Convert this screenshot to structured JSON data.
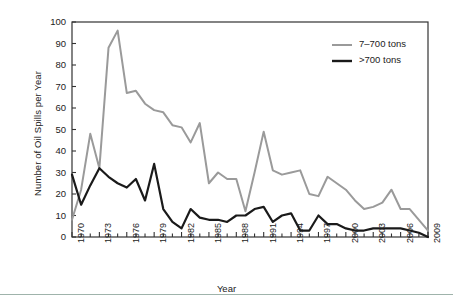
{
  "figure": {
    "background_color": "#ffffff",
    "footer_rule_color": "#9fb3ab"
  },
  "chart_data": {
    "type": "line",
    "title": "",
    "xlabel": "Year",
    "ylabel": "Number of Oil Spills per Year",
    "xlim": [
      1970,
      2009
    ],
    "ylim": [
      0,
      100
    ],
    "yticks": [
      0,
      10,
      20,
      30,
      40,
      50,
      60,
      70,
      80,
      90,
      100
    ],
    "xticks_labeled": [
      1970,
      1973,
      1976,
      1979,
      1982,
      1985,
      1988,
      1991,
      1994,
      1997,
      2000,
      2003,
      2006,
      2009
    ],
    "xtick_interval_minor": 1,
    "grid": false,
    "legend_position": "top-right",
    "x": [
      1970,
      1971,
      1972,
      1973,
      1974,
      1975,
      1976,
      1977,
      1978,
      1979,
      1980,
      1981,
      1982,
      1983,
      1984,
      1985,
      1986,
      1987,
      1988,
      1989,
      1990,
      1991,
      1992,
      1993,
      1994,
      1995,
      1996,
      1997,
      1998,
      1999,
      2000,
      2001,
      2002,
      2003,
      2004,
      2005,
      2006,
      2007,
      2008,
      2009
    ],
    "series": [
      {
        "name": "7–700 tons",
        "color": "#9a9a9a",
        "line_width": 2,
        "values": [
          8,
          22,
          48,
          32,
          88,
          96,
          67,
          68,
          62,
          59,
          58,
          52,
          51,
          44,
          53,
          25,
          30,
          27,
          27,
          12,
          30,
          49,
          31,
          29,
          30,
          31,
          20,
          19,
          28,
          25,
          22,
          17,
          13,
          14,
          16,
          22,
          13,
          13,
          8,
          3
        ]
      },
      {
        "name": ">700 tons",
        "color": "#1a1a1a",
        "line_width": 2.2,
        "values": [
          29,
          15,
          24,
          32,
          28,
          25,
          23,
          27,
          17,
          34,
          13,
          7,
          4,
          13,
          9,
          8,
          8,
          7,
          10,
          10,
          13,
          14,
          7,
          10,
          11,
          3,
          3,
          10,
          6,
          6,
          4,
          3,
          3,
          4,
          4,
          4,
          4,
          3,
          2,
          0
        ]
      }
    ],
    "legend": [
      {
        "label": "7–700 tons",
        "color": "#9a9a9a"
      },
      {
        "label": ">700 tons",
        "color": "#1a1a1a"
      }
    ]
  }
}
